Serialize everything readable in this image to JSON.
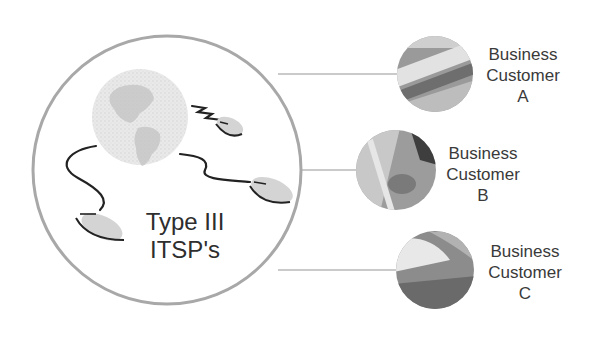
{
  "diagram": {
    "hub": {
      "title_line1": "Type III",
      "title_line2": "ITSP's"
    },
    "customers": [
      {
        "line1": "Business",
        "line2": "Customer",
        "line3": "A"
      },
      {
        "line1": "Business",
        "line2": "Customer",
        "line3": "B"
      },
      {
        "line1": "Business",
        "line2": "Customer",
        "line3": "C"
      }
    ],
    "colors": {
      "hub_stroke": "#a8a8a8",
      "connector": "#b8b8b8",
      "text": "#3a3a3a",
      "globe": "#d8d8d8",
      "mouse_fill": "#d4d4d4",
      "cable": "#222222"
    }
  }
}
